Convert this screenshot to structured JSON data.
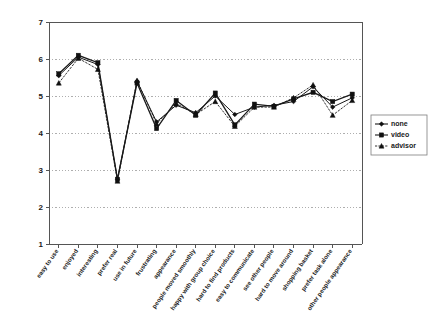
{
  "chart_data": {
    "type": "line",
    "title": "",
    "subtitle": "",
    "xlabel": "",
    "ylabel": "",
    "ylim": [
      1,
      7
    ],
    "ytick_labels": [
      "1",
      "2",
      "3",
      "4",
      "5",
      "6",
      "7"
    ],
    "yticks": [
      1,
      2,
      3,
      4,
      5,
      6,
      7
    ],
    "grid": true,
    "grid_axis": "y",
    "legend_position": "right",
    "categories": [
      "easy to use",
      "enjoyed",
      "interesting",
      "prefer real",
      "use in future",
      "frustrating",
      "appearance",
      "people moved smoothly",
      "happy with group choice",
      "hard to find products",
      "easy to communicate",
      "see other people",
      "hard to move around",
      "shopping basket",
      "prefer task alone",
      "other people appearance"
    ],
    "series": [
      {
        "name": "none",
        "marker": "diamond",
        "values": [
          5.55,
          6.05,
          5.85,
          2.75,
          5.4,
          4.3,
          4.75,
          4.55,
          5.0,
          4.5,
          4.7,
          4.75,
          4.85,
          5.25,
          4.7,
          4.95
        ]
      },
      {
        "name": "video",
        "marker": "square",
        "values": [
          5.6,
          6.1,
          5.9,
          2.75,
          5.35,
          4.12,
          4.88,
          4.48,
          5.08,
          4.22,
          4.78,
          4.72,
          4.92,
          5.1,
          4.85,
          5.05
        ]
      },
      {
        "name": "advisor",
        "marker": "triangle",
        "values": [
          5.35,
          6.02,
          5.72,
          2.7,
          5.42,
          4.25,
          4.8,
          4.5,
          4.85,
          4.18,
          4.7,
          4.7,
          4.95,
          5.3,
          4.48,
          4.88
        ]
      }
    ]
  },
  "legend": {
    "entries": [
      {
        "label": "none"
      },
      {
        "label": "video"
      },
      {
        "label": "advisor"
      }
    ]
  }
}
